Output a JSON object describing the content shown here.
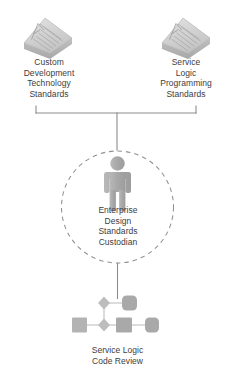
{
  "diagram": {
    "type": "soa-role-relationship-diagram",
    "background_color": "#ffffff",
    "text_color": "#3d3d3d",
    "line_color": "#8c8c8c",
    "shape_fill": "#b4b4b4",
    "icon_fill": "#c9c9c9",
    "nodes": [
      {
        "id": "custom-dev-standards",
        "label": "Custom\nDevelopment\nTechnology\nStandards",
        "icon": "standards-document-icon",
        "position": "top-left"
      },
      {
        "id": "service-logic-standards",
        "label": "Service\nLogic\nProgramming\nStandards",
        "icon": "standards-document-icon",
        "position": "top-right"
      },
      {
        "id": "enterprise-design-standards-custodian",
        "label": "Enterprise\nDesign\nStandards\nCustodian",
        "icon": "person-role-icon",
        "position": "center",
        "boundary": "dashed-circle"
      },
      {
        "id": "service-logic-code-review",
        "label": "Service Logic\nCode Review",
        "icon": "process-workflow-icon",
        "position": "bottom"
      }
    ],
    "connectors": [
      {
        "id": "bracket-standards-to-custodian",
        "style": "solid"
      },
      {
        "id": "line-custodian-to-code-review",
        "style": "solid"
      }
    ]
  }
}
